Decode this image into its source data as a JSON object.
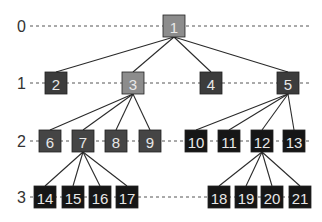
{
  "diagram": {
    "type": "tree",
    "levels": [
      {
        "label": "0",
        "y": 26
      },
      {
        "label": "1",
        "y": 83
      },
      {
        "label": "2",
        "y": 141
      },
      {
        "label": "3",
        "y": 197
      }
    ],
    "colors": {
      "light": "#8c8c8c",
      "medium": "#3c3c3c",
      "mid2": "#454545",
      "dark": "#161616",
      "edge": "#2a2a2a",
      "dash": "#555555"
    },
    "nodes": [
      {
        "id": "1",
        "level": 0,
        "x": 174,
        "tone": "light"
      },
      {
        "id": "2",
        "level": 1,
        "x": 56,
        "tone": "medium"
      },
      {
        "id": "3",
        "level": 1,
        "x": 133,
        "tone": "light"
      },
      {
        "id": "4",
        "level": 1,
        "x": 211,
        "tone": "medium"
      },
      {
        "id": "5",
        "level": 1,
        "x": 288,
        "tone": "medium"
      },
      {
        "id": "6",
        "level": 2,
        "x": 50,
        "tone": "mid2"
      },
      {
        "id": "7",
        "level": 2,
        "x": 83,
        "tone": "mid2"
      },
      {
        "id": "8",
        "level": 2,
        "x": 116,
        "tone": "mid2"
      },
      {
        "id": "9",
        "level": 2,
        "x": 150,
        "tone": "mid2"
      },
      {
        "id": "10",
        "level": 2,
        "x": 196,
        "tone": "dark"
      },
      {
        "id": "11",
        "level": 2,
        "x": 229,
        "tone": "dark"
      },
      {
        "id": "12",
        "level": 2,
        "x": 262,
        "tone": "dark"
      },
      {
        "id": "13",
        "level": 2,
        "x": 294,
        "tone": "dark"
      },
      {
        "id": "14",
        "level": 3,
        "x": 45,
        "tone": "dark"
      },
      {
        "id": "15",
        "level": 3,
        "x": 73,
        "tone": "dark"
      },
      {
        "id": "16",
        "level": 3,
        "x": 100,
        "tone": "dark"
      },
      {
        "id": "17",
        "level": 3,
        "x": 127,
        "tone": "dark"
      },
      {
        "id": "18",
        "level": 3,
        "x": 219,
        "tone": "dark"
      },
      {
        "id": "19",
        "level": 3,
        "x": 246,
        "tone": "dark"
      },
      {
        "id": "20",
        "level": 3,
        "x": 272,
        "tone": "dark"
      },
      {
        "id": "21",
        "level": 3,
        "x": 300,
        "tone": "dark"
      }
    ],
    "edges": [
      [
        "1",
        "2"
      ],
      [
        "1",
        "3"
      ],
      [
        "1",
        "4"
      ],
      [
        "1",
        "5"
      ],
      [
        "3",
        "6"
      ],
      [
        "3",
        "7"
      ],
      [
        "3",
        "8"
      ],
      [
        "3",
        "9"
      ],
      [
        "5",
        "10"
      ],
      [
        "5",
        "11"
      ],
      [
        "5",
        "12"
      ],
      [
        "5",
        "13"
      ],
      [
        "7",
        "14"
      ],
      [
        "7",
        "15"
      ],
      [
        "7",
        "16"
      ],
      [
        "7",
        "17"
      ],
      [
        "12",
        "18"
      ],
      [
        "12",
        "19"
      ],
      [
        "12",
        "20"
      ],
      [
        "12",
        "21"
      ]
    ]
  }
}
